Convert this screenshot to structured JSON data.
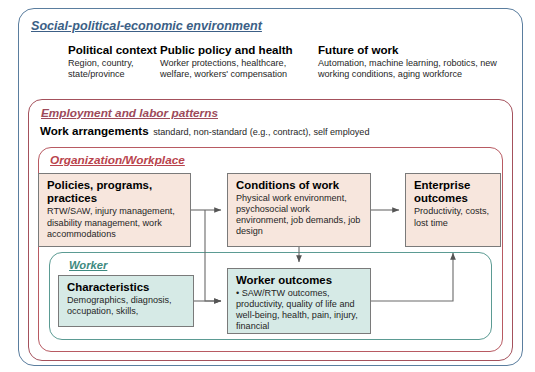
{
  "diagram": {
    "frames": {
      "social": {
        "label": "Social-political-economic environment",
        "border_color": "#5a7d9e"
      },
      "employment": {
        "label": "Employment and labor patterns",
        "border_color": "#a4515c"
      },
      "organization": {
        "label": "Organization/Workplace",
        "border_color": "#b85a62"
      },
      "worker": {
        "label": "Worker",
        "border_color": "#5b9b93"
      }
    },
    "columns": [
      {
        "heading": "Political context",
        "body": "Region, country, state/province"
      },
      {
        "heading": "Public policy and health",
        "body": "Worker protections, healthcare, welfare, workers' compensation"
      },
      {
        "heading": "Future of work",
        "body": "Automation, machine learning, robotics, new working conditions, aging workforce"
      }
    ],
    "work_arrangements": {
      "label": "Work arrangements",
      "detail": "standard, non-standard (e.g., contract), self employed"
    },
    "boxes": {
      "policies": {
        "title": "Policies, programs, practices",
        "body": "RTW/SAW, injury management, disability management, work accommodations",
        "fill": "#f7e6dd"
      },
      "conditions": {
        "title": "Conditions of work",
        "body": "Physical work environment, psychosocial work environment, job demands, job design",
        "fill": "#f7e6dd"
      },
      "enterprise": {
        "title": "Enterprise outcomes",
        "body": "Productivity, costs, lost time",
        "fill": "#f7e6dd"
      },
      "characteristics": {
        "title": "Characteristics",
        "body": "Demographics, diagnosis, occupation, skills,",
        "fill": "#d6eae6"
      },
      "worker_outcomes": {
        "title": "Worker outcomes",
        "body": "• SAW/RTW outcomes, productivity, quality of life and well-being, health, pain, injury, financial",
        "fill": "#d6eae6"
      }
    },
    "connectors": [
      {
        "name": "policies-to-conditions",
        "from": "policies",
        "to": "conditions"
      },
      {
        "name": "conditions-to-enterprise",
        "from": "conditions",
        "to": "enterprise"
      },
      {
        "name": "policies-to-worker-outcomes",
        "from": "policies",
        "to": "worker_outcomes"
      },
      {
        "name": "conditions-to-worker-outcomes",
        "from": "conditions",
        "to": "worker_outcomes"
      },
      {
        "name": "characteristics-to-worker-outcomes",
        "from": "characteristics",
        "to": "worker_outcomes"
      },
      {
        "name": "worker-outcomes-to-enterprise",
        "from": "worker_outcomes",
        "to": "enterprise"
      }
    ]
  }
}
